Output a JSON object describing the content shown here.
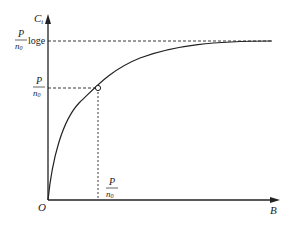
{
  "diagram": {
    "y_axis_label": "C",
    "y_axis_label_sub": "t",
    "x_axis_label": "B",
    "origin_label": "O",
    "upper_level_label": {
      "numerator": "P",
      "denominator": "n",
      "denominator_sub": "0",
      "suffix": "loge"
    },
    "mid_level_label": {
      "numerator": "P",
      "denominator": "n",
      "denominator_sub": "0"
    },
    "x_mark_label": {
      "numerator": "P",
      "denominator": "n",
      "denominator_sub": "0"
    },
    "colors": {
      "line": "#222222",
      "background": "#ffffff"
    }
  }
}
